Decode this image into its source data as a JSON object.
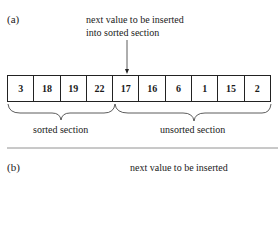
{
  "panel_a": {
    "label": "(a)",
    "pointer_text_line1": "next value to be inserted",
    "pointer_text_line2": "into sorted section",
    "array": [
      "3",
      "18",
      "19",
      "22",
      "17",
      "16",
      "6",
      "1",
      "15",
      "2"
    ],
    "sorted_label": "sorted section",
    "unsorted_label": "unsorted section"
  },
  "panel_b": {
    "label": "(b)",
    "pointer_text_line1": "next value to be inserted"
  }
}
